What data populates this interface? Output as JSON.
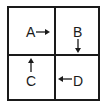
{
  "diagram": {
    "quadrants": [
      {
        "position": "top-left",
        "label": "A",
        "arrow_direction": "right"
      },
      {
        "position": "top-right",
        "label": "B",
        "arrow_direction": "down"
      },
      {
        "position": "bottom-left",
        "label": "C",
        "arrow_direction": "up"
      },
      {
        "position": "bottom-right",
        "label": "D",
        "arrow_direction": "left"
      }
    ],
    "colors": {
      "line": "#1a1a1a",
      "background": "#ffffff"
    }
  }
}
